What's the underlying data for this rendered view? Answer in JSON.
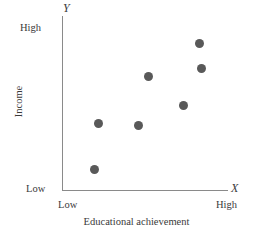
{
  "figure": {
    "width": 273,
    "height": 241,
    "background": "#ffffff",
    "marker_color": "#595959",
    "axis_color": "#8a8a8a",
    "text_color": "#3a3a3a"
  },
  "axes": {
    "y_variable_glyph": "Y",
    "x_variable_glyph": "X",
    "y_title": "Income",
    "x_title": "Educational achievement",
    "y_tick_high": "High",
    "y_tick_low": "Low",
    "x_tick_low": "Low",
    "x_tick_high": "High",
    "y_line": {
      "x": 62,
      "top": 16,
      "bottom": 191
    },
    "x_line": {
      "y": 190,
      "left": 62,
      "right": 228
    }
  },
  "chart_data": {
    "type": "scatter",
    "title": "",
    "xlabel": "Educational achievement",
    "ylabel": "Income",
    "xticklabels": [
      "Low",
      "High"
    ],
    "yticklabels": [
      "Low",
      "High"
    ],
    "xlim": [
      0,
      1
    ],
    "ylim": [
      0,
      1
    ],
    "grid": false,
    "legend": false,
    "marker_color": "#595959",
    "marker_size_px": 9,
    "n_points": 7,
    "points": [
      {
        "px": 94,
        "py": 169,
        "x": 0.19,
        "y": 0.12
      },
      {
        "px": 98,
        "py": 123,
        "x": 0.22,
        "y": 0.38
      },
      {
        "px": 138,
        "py": 125,
        "x": 0.46,
        "y": 0.37
      },
      {
        "px": 148,
        "py": 76,
        "x": 0.52,
        "y": 0.65
      },
      {
        "px": 183,
        "py": 105,
        "x": 0.73,
        "y": 0.49
      },
      {
        "px": 201,
        "py": 68,
        "x": 0.84,
        "y": 0.7
      },
      {
        "px": 199,
        "py": 43,
        "x": 0.82,
        "y": 0.84
      }
    ]
  }
}
